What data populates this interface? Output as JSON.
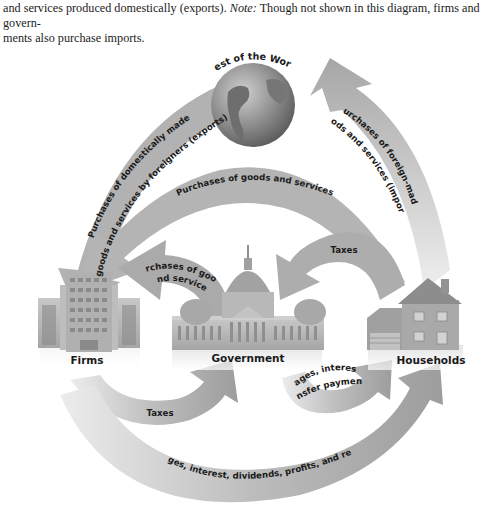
{
  "caption": {
    "line1_prefix": "and services produced domestically (exports).",
    "note_label": "Note:",
    "line1_suffix": "Though not shown in this diagram, firms and govern-",
    "line2": "ments also purchase imports."
  },
  "nodes": {
    "world": {
      "label": "Rest of the World",
      "icon": "globe-icon"
    },
    "firms": {
      "label": "Firms",
      "icon": "office-building-icon"
    },
    "government": {
      "label": "Government",
      "icon": "capitol-building-icon"
    },
    "households": {
      "label": "Households",
      "icon": "house-icon"
    }
  },
  "flows": {
    "exports": {
      "line1": "Purchases of domestically made",
      "line2": "goods and services by foreigners (exports)",
      "from": "Rest of the World",
      "to": "Firms"
    },
    "imports": {
      "line1": "Purchases of foreign-made",
      "line2": "goods and services (imports)",
      "from": "Households",
      "to": "Rest of the World"
    },
    "household_purchases": {
      "label": "Purchases of goods and services",
      "from": "Households",
      "to": "Firms"
    },
    "gov_purchases": {
      "line1": "Purchases of goods",
      "line2": "and services",
      "from": "Government",
      "to": "Firms"
    },
    "household_taxes": {
      "label": "Taxes",
      "from": "Households",
      "to": "Government"
    },
    "firm_taxes": {
      "label": "Taxes",
      "from": "Firms",
      "to": "Government"
    },
    "gov_payments": {
      "line1": "Wages, interest,",
      "line2": "transfer payments",
      "from": "Government",
      "to": "Households"
    },
    "factor_payments": {
      "label": "Wages, interest, dividends, profits, and rent",
      "from": "Firms",
      "to": "Households"
    }
  },
  "colors": {
    "arrow": "#a9a9a9",
    "arrow_light": "#d6d6d6",
    "building": "#b5b5b5",
    "text": "#1a1a1a"
  }
}
